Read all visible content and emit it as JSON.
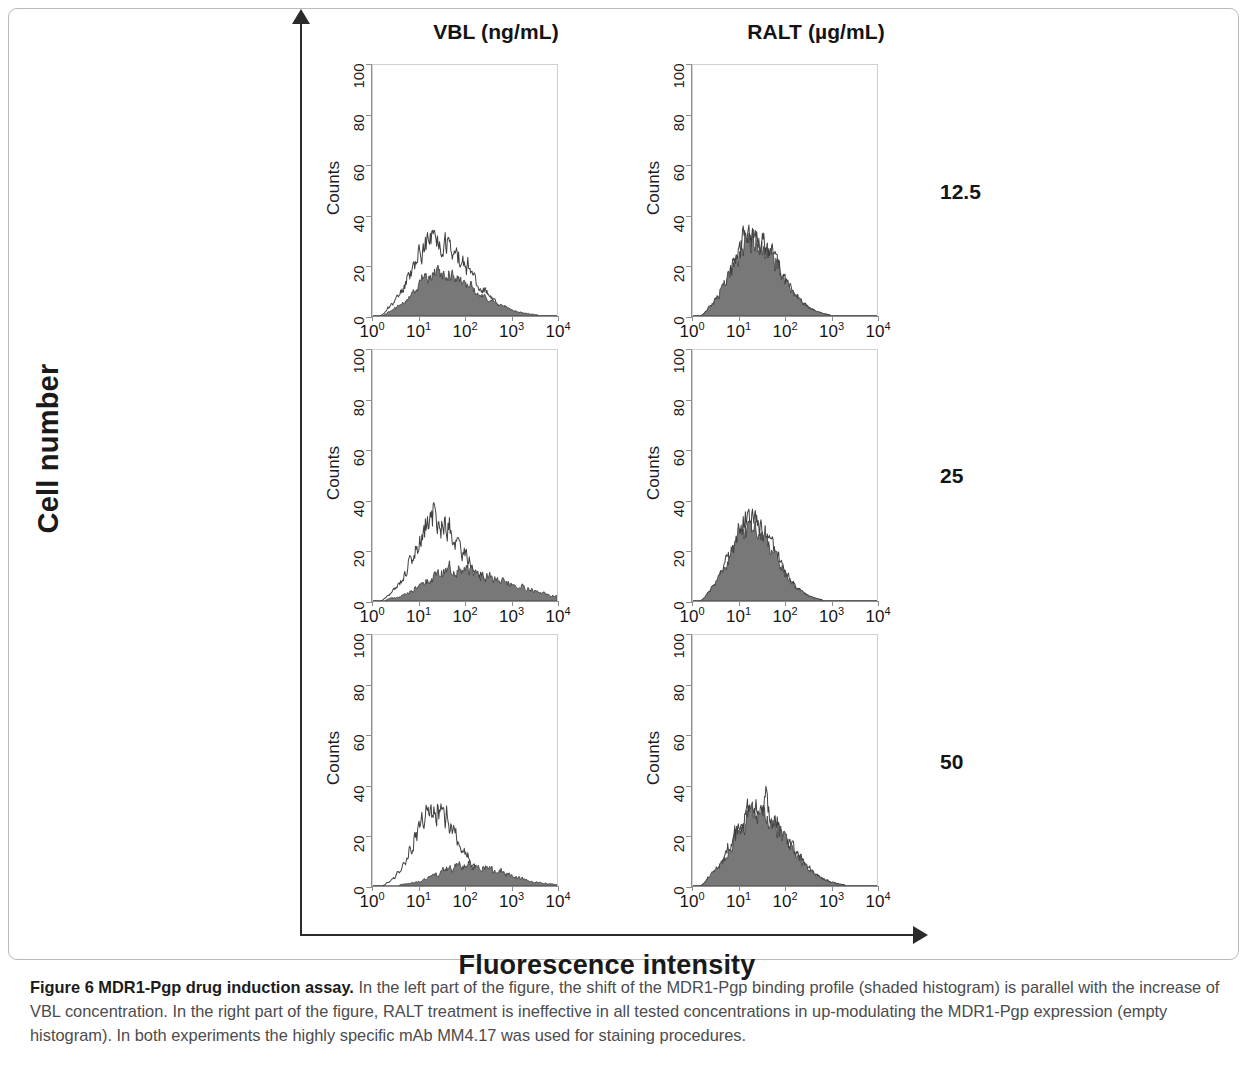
{
  "figure": {
    "caption_bold": "Figure 6 MDR1-Pgp drug induction assay.",
    "caption_rest": " In the left part of the figure, the shift of the MDR1-Pgp binding profile (shaded histogram) is parallel with the increase of VBL concentration. In the right part of the figure, RALT treatment is ineffective in all tested concentrations in up-modulating the MDR1-Pgp expression (empty histogram). In both experiments the highly specific mAb MM4.17 was used for staining procedures.",
    "global_y_label": "Cell number",
    "global_x_label": "Fluorescence intensity"
  },
  "columns": [
    {
      "label": "VBL (ng/mL)"
    },
    {
      "label": "RALT (µg/mL)"
    }
  ],
  "rows": [
    {
      "label": "12.5"
    },
    {
      "label": "25"
    },
    {
      "label": "50"
    }
  ],
  "colors": {
    "shaded_fill": "#787878",
    "shaded_stroke": "#3a3a3a",
    "empty_stroke": "#404040",
    "frame": "#cfd0d1",
    "axis": "#8d8e90",
    "text": "#1c1c1c",
    "global_axis": "#2b2b2b"
  },
  "chart_data": {
    "type": "line",
    "xlabel": "Fluorescence intensity",
    "ylabel": "Cell number",
    "panel_xlabel": "",
    "panel_ylabel": "Counts",
    "xscale": "log",
    "xlim": [
      1,
      10000
    ],
    "ylim": [
      0,
      100
    ],
    "xticks": [
      1,
      10,
      100,
      1000,
      10000
    ],
    "xtick_labels": [
      "10<sup>0</sup>",
      "10<sup>1</sup>",
      "10<sup>2</sup>",
      "10<sup>3</sup>",
      "10<sup>4</sup>"
    ],
    "yticks": [
      0,
      20,
      40,
      60,
      80,
      100
    ],
    "ytick_labels": [
      "0",
      "20",
      "40",
      "60",
      "80",
      "100"
    ],
    "grid": false,
    "legend": "none",
    "series_names": [
      "empty histogram (control)",
      "shaded histogram (MDR1-Pgp)"
    ],
    "panels": [
      {
        "id": "vbl-12.5",
        "row": "12.5",
        "column": "VBL (ng/mL)",
        "series": [
          {
            "name": "empty histogram (control)",
            "style": "outline",
            "peak_decade": 1.3,
            "peak_counts": 31,
            "spread_decades": 0.46,
            "skew": 0.18,
            "noise": 0.3,
            "seed": 11
          },
          {
            "name": "shaded histogram (MDR1-Pgp)",
            "style": "shaded",
            "peak_decade": 1.38,
            "peak_counts": 17,
            "spread_decades": 0.48,
            "skew": 0.22,
            "noise": 0.26,
            "seed": 12
          }
        ]
      },
      {
        "id": "ralt-12.5",
        "row": "12.5",
        "column": "RALT (µg/mL)",
        "series": [
          {
            "name": "empty histogram (control)",
            "style": "outline",
            "peak_decade": 1.28,
            "peak_counts": 31,
            "spread_decades": 0.44,
            "skew": 0.1,
            "noise": 0.3,
            "seed": 21
          },
          {
            "name": "shaded histogram (MDR1-Pgp)",
            "style": "shaded",
            "peak_decade": 1.26,
            "peak_counts": 29,
            "spread_decades": 0.45,
            "skew": 0.1,
            "noise": 0.28,
            "seed": 22
          }
        ]
      },
      {
        "id": "vbl-25",
        "row": "25",
        "column": "VBL (ng/mL)",
        "series": [
          {
            "name": "empty histogram (control)",
            "style": "outline",
            "peak_decade": 1.32,
            "peak_counts": 31,
            "spread_decades": 0.44,
            "skew": 0.15,
            "noise": 0.3,
            "seed": 31
          },
          {
            "name": "shaded histogram (MDR1-Pgp)",
            "style": "shaded",
            "peak_decade": 1.72,
            "peak_counts": 12,
            "spread_decades": 0.6,
            "skew": 0.3,
            "noise": 0.34,
            "seed": 32
          }
        ]
      },
      {
        "id": "ralt-25",
        "row": "25",
        "column": "RALT (µg/mL)",
        "series": [
          {
            "name": "empty histogram (control)",
            "style": "outline",
            "peak_decade": 1.24,
            "peak_counts": 31,
            "spread_decades": 0.43,
            "skew": 0.08,
            "noise": 0.3,
            "seed": 41
          },
          {
            "name": "shaded histogram (MDR1-Pgp)",
            "style": "shaded",
            "peak_decade": 1.22,
            "peak_counts": 29,
            "spread_decades": 0.44,
            "skew": 0.08,
            "noise": 0.28,
            "seed": 42
          }
        ]
      },
      {
        "id": "vbl-50",
        "row": "50",
        "column": "VBL (ng/mL)",
        "series": [
          {
            "name": "empty histogram (control)",
            "style": "outline",
            "peak_decade": 1.3,
            "peak_counts": 30,
            "spread_decades": 0.4,
            "skew": 0.1,
            "noise": 0.28,
            "seed": 51
          },
          {
            "name": "shaded histogram (MDR1-Pgp)",
            "style": "shaded",
            "peak_decade": 2.05,
            "peak_counts": 8,
            "spread_decades": 0.62,
            "skew": 0.1,
            "noise": 0.4,
            "seed": 52
          }
        ]
      },
      {
        "id": "ralt-50",
        "row": "50",
        "column": "RALT (µg/mL)",
        "series": [
          {
            "name": "empty histogram (control)",
            "style": "outline",
            "peak_decade": 1.36,
            "peak_counts": 31,
            "spread_decades": 0.48,
            "skew": 0.12,
            "noise": 0.3,
            "seed": 61
          },
          {
            "name": "shaded histogram (MDR1-Pgp)",
            "style": "shaded",
            "peak_decade": 1.34,
            "peak_counts": 29,
            "spread_decades": 0.49,
            "skew": 0.12,
            "noise": 0.28,
            "seed": 62
          }
        ]
      }
    ]
  }
}
